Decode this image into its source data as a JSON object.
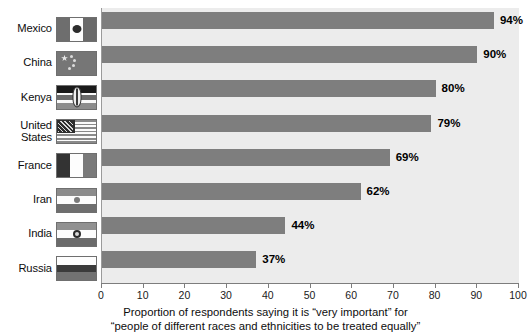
{
  "chart_data": {
    "type": "bar",
    "orientation": "horizontal",
    "title": "",
    "subtitle": "",
    "xlabel": "Proportion of respondents saying it is \"very important\" for \"people of different races and ethnicities to be treated equally\"",
    "ylabel": "",
    "xlim": [
      0,
      100
    ],
    "xticks": [
      0,
      10,
      20,
      30,
      40,
      50,
      60,
      70,
      80,
      90,
      100
    ],
    "grid": false,
    "legend": null,
    "categories": [
      "Mexico",
      "China",
      "Kenya",
      "United States",
      "France",
      "Iran",
      "India",
      "Russia"
    ],
    "values": [
      94,
      90,
      80,
      79,
      69,
      62,
      44,
      37
    ],
    "value_labels": [
      "94%",
      "90%",
      "80%",
      "79%",
      "69%",
      "62%",
      "44%",
      "37%"
    ],
    "bar_color": "#7e7e7e",
    "plot_background": "#ececec"
  },
  "caption": {
    "line1": "Proportion of respondents saying it is “very important” for",
    "line2": "“people of different races and ethnicities to be treated equally”"
  },
  "rows": [
    {
      "country": "Mexico",
      "label": "Mexico",
      "value": 94,
      "value_label": "94%",
      "flag": "mexico-flag"
    },
    {
      "country": "China",
      "label": "China",
      "value": 90,
      "value_label": "90%",
      "flag": "china-flag"
    },
    {
      "country": "Kenya",
      "label": "Kenya",
      "value": 80,
      "value_label": "80%",
      "flag": "kenya-flag"
    },
    {
      "country": "United States",
      "label": "United\nStates",
      "value": 79,
      "value_label": "79%",
      "flag": "united-states-flag"
    },
    {
      "country": "France",
      "label": "France",
      "value": 69,
      "value_label": "69%",
      "flag": "france-flag"
    },
    {
      "country": "Iran",
      "label": "Iran",
      "value": 62,
      "value_label": "62%",
      "flag": "iran-flag"
    },
    {
      "country": "India",
      "label": "India",
      "value": 44,
      "value_label": "44%",
      "flag": "india-flag"
    },
    {
      "country": "Russia",
      "label": "Russia",
      "value": 37,
      "value_label": "37%",
      "flag": "russia-flag"
    }
  ],
  "axis": {
    "ticks": [
      "0",
      "10",
      "20",
      "30",
      "40",
      "50",
      "60",
      "70",
      "80",
      "90",
      "100"
    ]
  }
}
